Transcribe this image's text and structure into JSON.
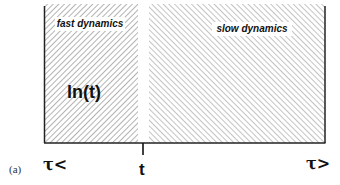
{
  "figure": {
    "panel_label": "(a)",
    "left_region": {
      "label": "fast dynamics",
      "hatch": "backslash",
      "inner_label": "ln(t)"
    },
    "right_region": {
      "label": "slow dynamics",
      "hatch": "forward-slash"
    },
    "axis": {
      "left_label": "τ<",
      "center_label": "t",
      "right_label": "τ>"
    },
    "colors": {
      "border": "#222222",
      "hatch": "#8a8a8a",
      "background": "#ffffff"
    }
  }
}
